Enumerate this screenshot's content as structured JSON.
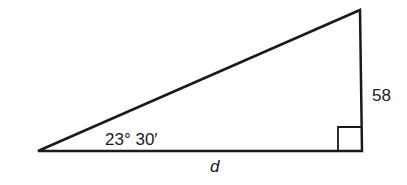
{
  "diagram": {
    "type": "right-triangle",
    "angle_label": "23° 30′",
    "opposite_side_label": "58",
    "adjacent_side_label": "d",
    "right_angle_marker": true,
    "vertices": {
      "left": [
        38,
        151
      ],
      "top_right": [
        360,
        10
      ],
      "bottom_right": [
        362,
        151
      ]
    },
    "colors": {
      "stroke": "#1a1a1a",
      "background": "#ffffff"
    }
  }
}
